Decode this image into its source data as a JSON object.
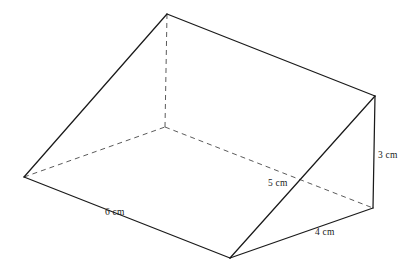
{
  "figure": {
    "kind": "triangular-prism-wedge",
    "stroke_color": "#1a1a1a",
    "hidden_stroke_color": "#5b5b5b",
    "background_color": "#ffffff",
    "vertices": {
      "apex_top_left": {
        "x": 167,
        "y": 14
      },
      "apex_top_right": {
        "x": 375,
        "y": 96
      },
      "left_corner": {
        "x": 24,
        "y": 177
      },
      "back_hidden": {
        "x": 165,
        "y": 127
      },
      "bottom_front": {
        "x": 230,
        "y": 258
      },
      "bottom_right": {
        "x": 373,
        "y": 208
      }
    },
    "labels": [
      {
        "id": "length-label",
        "text": "6 cm",
        "x": 105,
        "y": 208
      },
      {
        "id": "slant-label",
        "text": "5 cm",
        "x": 268,
        "y": 179
      },
      {
        "id": "base-width-label",
        "text": "4 cm",
        "x": 315,
        "y": 228
      },
      {
        "id": "height-label",
        "text": "3 cm",
        "x": 378,
        "y": 151
      }
    ]
  }
}
